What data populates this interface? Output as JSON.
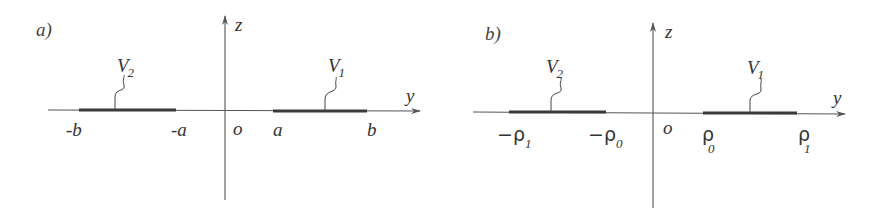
{
  "panels": [
    {
      "id": "a",
      "label": "a)",
      "axes": {
        "vertical": "z",
        "horizontal": "y",
        "origin": "o"
      },
      "segments": [
        {
          "name": "V",
          "subscript": "2",
          "start_label": "-b",
          "end_label": "-a"
        },
        {
          "name": "V",
          "subscript": "1",
          "start_label": "a",
          "end_label": "b"
        }
      ]
    },
    {
      "id": "b",
      "label": "b)",
      "axes": {
        "vertical": "z",
        "horizontal": "y",
        "origin": "o"
      },
      "segments": [
        {
          "name": "V",
          "subscript": "2",
          "start_label": "−ρ",
          "start_sub": "1",
          "end_label": "−ρ",
          "end_sub": "0"
        },
        {
          "name": "V",
          "subscript": "1",
          "start_label": "ρ",
          "start_sub": "0",
          "end_label": "ρ",
          "end_sub": "1"
        }
      ]
    }
  ]
}
